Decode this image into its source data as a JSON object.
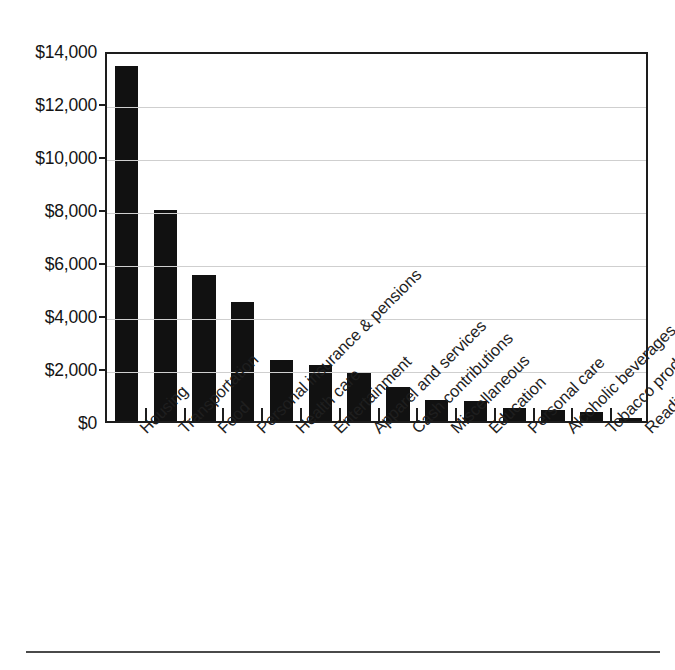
{
  "chart_data": {
    "type": "bar",
    "title": "",
    "subtitle": "",
    "xlabel": "",
    "ylabel": "",
    "ylim": [
      0,
      14000
    ],
    "ytick_step": 2000,
    "grid": true,
    "legend": null,
    "orientation": "vertical",
    "bar_color": "#111111",
    "categories": [
      "Housing",
      "Transportation",
      "Food",
      "Personal insurance & pensions",
      "Health care",
      "Entertainment",
      "Apparel and services",
      "Cash contributions",
      "Miscellaneous",
      "Education",
      "Personal care",
      "Alcoholic beverages",
      "Tobacco products",
      "Reading"
    ],
    "values": [
      13400,
      7950,
      5500,
      4500,
      2300,
      2100,
      1800,
      1300,
      800,
      750,
      500,
      400,
      350,
      100
    ],
    "ytick_labels": [
      "$0",
      "$2,000",
      "$4,000",
      "$6,000",
      "$8,000",
      "$10,000",
      "$12,000",
      "$14,000"
    ],
    "ytick_values": [
      0,
      2000,
      4000,
      6000,
      8000,
      10000,
      12000,
      14000
    ]
  },
  "colors": {
    "bar": "#111111",
    "frame": "#1d1d1d",
    "gridline": "#cfcfcf",
    "rule": "#4a4a4a",
    "background": "#ffffff",
    "text": "#1a1a1a"
  }
}
